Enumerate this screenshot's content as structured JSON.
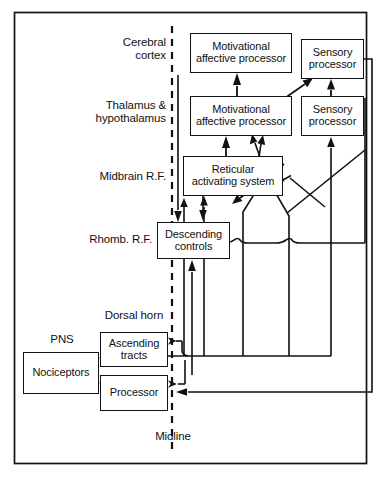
{
  "figure": {
    "kind": "pain-pathway-block-diagram",
    "background_color": "#ffffff",
    "line_color": "#111111",
    "frame": {
      "x": 14,
      "y": 12,
      "width": 353,
      "height": 452
    }
  },
  "midline": {
    "label": "Midline",
    "x": 172,
    "style": "dashed-vertical"
  },
  "region_labels": [
    {
      "id": "cerebral-cortex",
      "text": "Cerebral\ncortex",
      "x": 64,
      "y": 36,
      "width": 110,
      "font_size": 11.5
    },
    {
      "id": "thalamus-hypothalamus",
      "text": "Thalamus &\nhypothalamus",
      "x": 44,
      "y": 99,
      "width": 130,
      "font_size": 11.5
    },
    {
      "id": "midbrain-rf",
      "text": "Midbrain R.F.",
      "x": 56,
      "y": 170,
      "width": 118,
      "font_size": 11.5
    },
    {
      "id": "rhomb-rf",
      "text": "Rhomb. R.F.",
      "x": 56,
      "y": 233,
      "width": 100,
      "font_size": 11.5
    }
  ],
  "side_labels": [
    {
      "id": "dorsal-horn",
      "text": "Dorsal horn",
      "x": 86,
      "y": 311,
      "width": 96,
      "font_size": 11.5
    },
    {
      "id": "pns",
      "text": "PNS",
      "x": 34,
      "y": 334,
      "width": 56,
      "font_size": 11.5
    },
    {
      "id": "midline-label",
      "text": "Midline",
      "x": 147,
      "y": 432,
      "width": 60,
      "font_size": 11.5
    }
  ],
  "nodes": [
    {
      "id": "cortex-motivational-affective-processor",
      "label": "Motivational\naffective processor",
      "x": 190,
      "y": 33,
      "width": 102,
      "height": 40,
      "font_size": 11
    },
    {
      "id": "cortex-sensory-processor",
      "label": "Sensory\nprocessor",
      "x": 301,
      "y": 39,
      "width": 63,
      "height": 40,
      "font_size": 11
    },
    {
      "id": "thalamus-motivational-affective-processor",
      "label": "Motivational\naffective processor",
      "x": 190,
      "y": 96,
      "width": 102,
      "height": 40,
      "font_size": 11
    },
    {
      "id": "thalamus-sensory-processor",
      "label": "Sensory\nprocessor",
      "x": 301,
      "y": 96,
      "width": 63,
      "height": 40,
      "font_size": 11
    },
    {
      "id": "reticular-activating-system",
      "label": "Reticular\nactivating system",
      "x": 183,
      "y": 156,
      "width": 100,
      "height": 40,
      "font_size": 11
    },
    {
      "id": "descending-controls",
      "label": "Descending\ncontrols",
      "x": 157,
      "y": 222,
      "width": 73,
      "height": 37,
      "font_size": 11
    },
    {
      "id": "ascending-tracts",
      "label": "Ascending\ntracts",
      "x": 100,
      "y": 332,
      "width": 68,
      "height": 35,
      "font_size": 11
    },
    {
      "id": "nociceptors",
      "label": "Nociceptors",
      "x": 23,
      "y": 352,
      "width": 76,
      "height": 42,
      "font_size": 11
    },
    {
      "id": "processor",
      "label": "Processor",
      "x": 100,
      "y": 375,
      "width": 68,
      "height": 36,
      "font_size": 11
    }
  ],
  "connections": [
    {
      "id": "nociceptors-to-ascending-tracts",
      "from": "nociceptors",
      "to": "ascending-tracts",
      "arrow": true
    },
    {
      "id": "nociceptors-to-processor",
      "from": "nociceptors",
      "to": "processor",
      "arrow": true
    },
    {
      "id": "thalamus-map-to-cortex-map",
      "from": "thalamus-motivational-affective-processor",
      "to": "cortex-motivational-affective-processor",
      "arrow": true
    },
    {
      "id": "thalamus-map-to-cortex-sensory",
      "from": "thalamus-motivational-affective-processor",
      "to": "cortex-sensory-processor",
      "arrow": true
    },
    {
      "id": "thalamus-sensory-to-cortex-sensory",
      "from": "thalamus-sensory-processor",
      "to": "cortex-sensory-processor",
      "arrow": true
    },
    {
      "id": "ras-to-thalamus-map",
      "from": "reticular-activating-system",
      "to": "thalamus-motivational-affective-processor",
      "arrow": true
    },
    {
      "id": "ras-to-descending-controls",
      "from": "reticular-activating-system",
      "to": "descending-controls",
      "arrow": true
    },
    {
      "id": "ascending-to-ras",
      "from": "ascending-tracts",
      "to": "reticular-activating-system",
      "arrow": true
    },
    {
      "id": "ascending-to-thalamus-map",
      "from": "ascending-tracts",
      "to": "thalamus-motivational-affective-processor",
      "arrow": true
    },
    {
      "id": "ascending-to-thalamus-sensory",
      "from": "ascending-tracts",
      "to": "thalamus-sensory-processor",
      "arrow": true
    },
    {
      "id": "ascending-to-cortex-sensory",
      "from": "ascending-tracts",
      "to": "cortex-sensory-processor",
      "arrow": true
    },
    {
      "id": "descending-controls-to-processor",
      "from": "descending-controls",
      "to": "processor",
      "arrow": true
    },
    {
      "id": "descending-controls-to-ascending-tracts",
      "from": "descending-controls",
      "to": "ascending-tracts",
      "arrow": true
    },
    {
      "id": "cortex-map-down-to-descending-controls",
      "from": "cortex-motivational-affective-processor",
      "to": "descending-controls",
      "arrow": true
    },
    {
      "id": "cortex-sensory-down-to-processor",
      "from": "cortex-sensory-processor",
      "to": "processor",
      "arrow": true
    },
    {
      "id": "ras-descending-midline-branch",
      "from": "reticular-activating-system",
      "to": "descending-controls",
      "arrow": true
    }
  ]
}
